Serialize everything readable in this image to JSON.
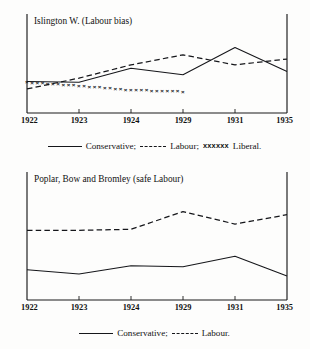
{
  "page": {
    "background": "#fdfdfc",
    "ink": "#15161a"
  },
  "figures": [
    {
      "id": "islington-w",
      "title": "Islington W. (Labour bias)",
      "legend": {
        "conservative_swatch": "solid-line",
        "conservative_label": "Conservative;",
        "labour_swatch": "dashed-line",
        "labour_label": "Labour;",
        "liberal_swatch": "xxxxxx",
        "liberal_label": "Liberal."
      },
      "chart_data": {
        "type": "line",
        "title": "Islington W. (Labour bias)",
        "xlabel": "",
        "ylabel": "",
        "grid": false,
        "legend_position": "below",
        "categories": [
          "1922",
          "1923",
          "1924",
          "1929",
          "1931",
          "1935"
        ],
        "x": [
          1922,
          1923,
          1924,
          1929,
          1931,
          1935
        ],
        "ylim": [
          0,
          100
        ],
        "series": [
          {
            "name": "Conservative",
            "style": "solid",
            "values": [
              38,
              37,
              54,
              46,
              79,
              50
            ]
          },
          {
            "name": "Labour",
            "style": "dashed",
            "values": [
              29,
              42,
              58,
              70,
              58,
              65
            ]
          },
          {
            "name": "Liberal",
            "style": "crosses",
            "values": [
              37,
              33,
              28,
              26,
              null,
              null
            ]
          }
        ]
      },
      "axis": {
        "tick_labels": [
          "1922",
          "1923",
          "1924",
          "1929",
          "1931",
          "1935"
        ]
      }
    },
    {
      "id": "poplar-bow-bromley",
      "title": "Poplar, Bow and Bromley (safe Labour)",
      "legend": {
        "conservative_swatch": "solid-line",
        "conservative_label": "Conservative;",
        "labour_swatch": "dashed-line",
        "labour_label": "Labour."
      },
      "chart_data": {
        "type": "line",
        "title": "Poplar, Bow and Bromley (safe Labour)",
        "xlabel": "",
        "ylabel": "",
        "grid": false,
        "legend_position": "below",
        "categories": [
          "1922",
          "1923",
          "1924",
          "1929",
          "1931",
          "1935"
        ],
        "x": [
          1922,
          1923,
          1924,
          1929,
          1931,
          1935
        ],
        "ylim": [
          0,
          100
        ],
        "series": [
          {
            "name": "Conservative",
            "style": "solid",
            "values": [
              29,
              25,
              33,
              32,
              42,
              23
            ]
          },
          {
            "name": "Labour",
            "style": "dashed",
            "values": [
              67,
              67,
              68,
              85,
              73,
              82
            ]
          }
        ]
      },
      "axis": {
        "tick_labels": [
          "1922",
          "1923",
          "1924",
          "1929",
          "1931",
          "1935"
        ]
      }
    }
  ]
}
